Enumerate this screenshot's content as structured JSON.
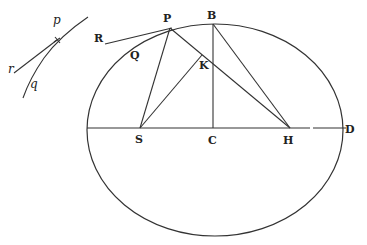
{
  "diagram": {
    "type": "geometric figure",
    "stroke_color": "#333333",
    "background": "#ffffff",
    "labels": {
      "P": "P",
      "B": "B",
      "R": "R",
      "Q": "Q",
      "K": "K",
      "S": "S",
      "C": "C",
      "H": "H",
      "D": "D",
      "p": "p",
      "r": "r",
      "q": "q"
    },
    "points": {
      "P": [
        170,
        28
      ],
      "B": [
        213,
        24
      ],
      "R": [
        105,
        44
      ],
      "K": [
        200,
        55
      ],
      "S": [
        140,
        128
      ],
      "C": [
        213,
        128
      ],
      "H": [
        290,
        128
      ],
      "D": [
        344,
        128
      ],
      "p": [
        57,
        40
      ]
    },
    "ellipse": {
      "cx": 215,
      "cy": 130,
      "rx": 128,
      "ry": 106
    },
    "segments": [
      [
        "R",
        "P",
        "tangent"
      ],
      [
        "P",
        "S",
        "radius"
      ],
      [
        "P",
        "H",
        "radius"
      ],
      [
        "B",
        "C",
        "semi-minor axis"
      ],
      [
        "B",
        "H",
        "line"
      ],
      [
        "S",
        "K",
        "line"
      ],
      [
        "axis-left",
        "D",
        "major axis"
      ]
    ]
  }
}
